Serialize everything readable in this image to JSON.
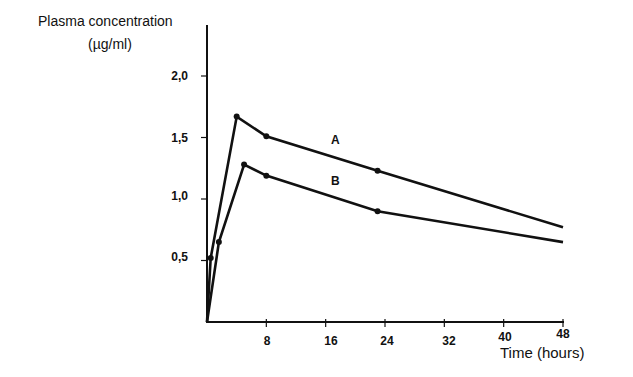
{
  "chart_data": {
    "type": "line",
    "title": "",
    "xlabel": "Time (hours)",
    "ylabel": "Plasma concentration",
    "ylabel_unit": "(µg/ml)",
    "xlim": [
      0,
      48
    ],
    "ylim": [
      0,
      2.0
    ],
    "x_ticks": [
      "8",
      "16",
      "24",
      "32",
      "40",
      "48"
    ],
    "y_ticks": [
      "0,5",
      "1,0",
      "1,5",
      "2,0"
    ],
    "grid": false,
    "legend": "inline labels",
    "series": [
      {
        "name": "A",
        "x": [
          0,
          0.5,
          4,
          8,
          23,
          48
        ],
        "y": [
          0,
          0.52,
          1.67,
          1.51,
          1.23,
          0.77
        ],
        "markers_at_index": [
          1,
          2,
          3,
          4
        ]
      },
      {
        "name": "B",
        "x": [
          0,
          1.6,
          5,
          8,
          23,
          48
        ],
        "y": [
          0,
          0.65,
          1.28,
          1.19,
          0.9,
          0.65
        ],
        "markers_at_index": [
          1,
          2,
          3,
          4
        ]
      }
    ]
  }
}
